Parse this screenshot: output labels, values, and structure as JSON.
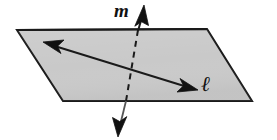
{
  "figure": {
    "name": "line-perpendicular-to-plane-diagram",
    "kind": "geometry-diagram",
    "canvas": {
      "width": 277,
      "height": 140,
      "background": "#ffffff"
    },
    "labels": {
      "line_m": "m",
      "line_l": "ℓ"
    },
    "plane": {
      "name": "plane",
      "shape": "parallelogram",
      "fill": "#c9c9c9",
      "stroke": "#1a1a1a",
      "stroke_width": 2,
      "points": "17,30 207,29 252,101 63,101"
    },
    "line_m": {
      "name": "line-m",
      "description": "Line m passing through the plane, dashed where hidden behind the plane, with arrowheads at both ends.",
      "stroke": "#1a1a1a",
      "stroke_width": 2,
      "dash_pattern": "6,5",
      "top_solid": {
        "x1": 138,
        "y1": 30,
        "x2": 143,
        "y2": 14
      },
      "hidden_dashed": {
        "x1": 138,
        "y1": 30,
        "x2": 126,
        "y2": 101
      },
      "bottom_solid": {
        "x1": 126,
        "y1": 101,
        "x2": 119,
        "y2": 130
      },
      "arrow_top_tip": {
        "x": 144,
        "y": 5
      },
      "arrow_bottom_tip": {
        "x": 118,
        "y": 137
      }
    },
    "line_l": {
      "name": "line-l",
      "description": "Line ℓ lying in the plane, double-headed arrow.",
      "stroke": "#1a1a1a",
      "stroke_width": 2,
      "x1": 43,
      "y1": 42,
      "x2": 198,
      "y2": 90,
      "arrow_left_tip": {
        "x": 43,
        "y": 42
      },
      "arrow_right_tip": {
        "x": 198,
        "y": 90
      }
    }
  }
}
